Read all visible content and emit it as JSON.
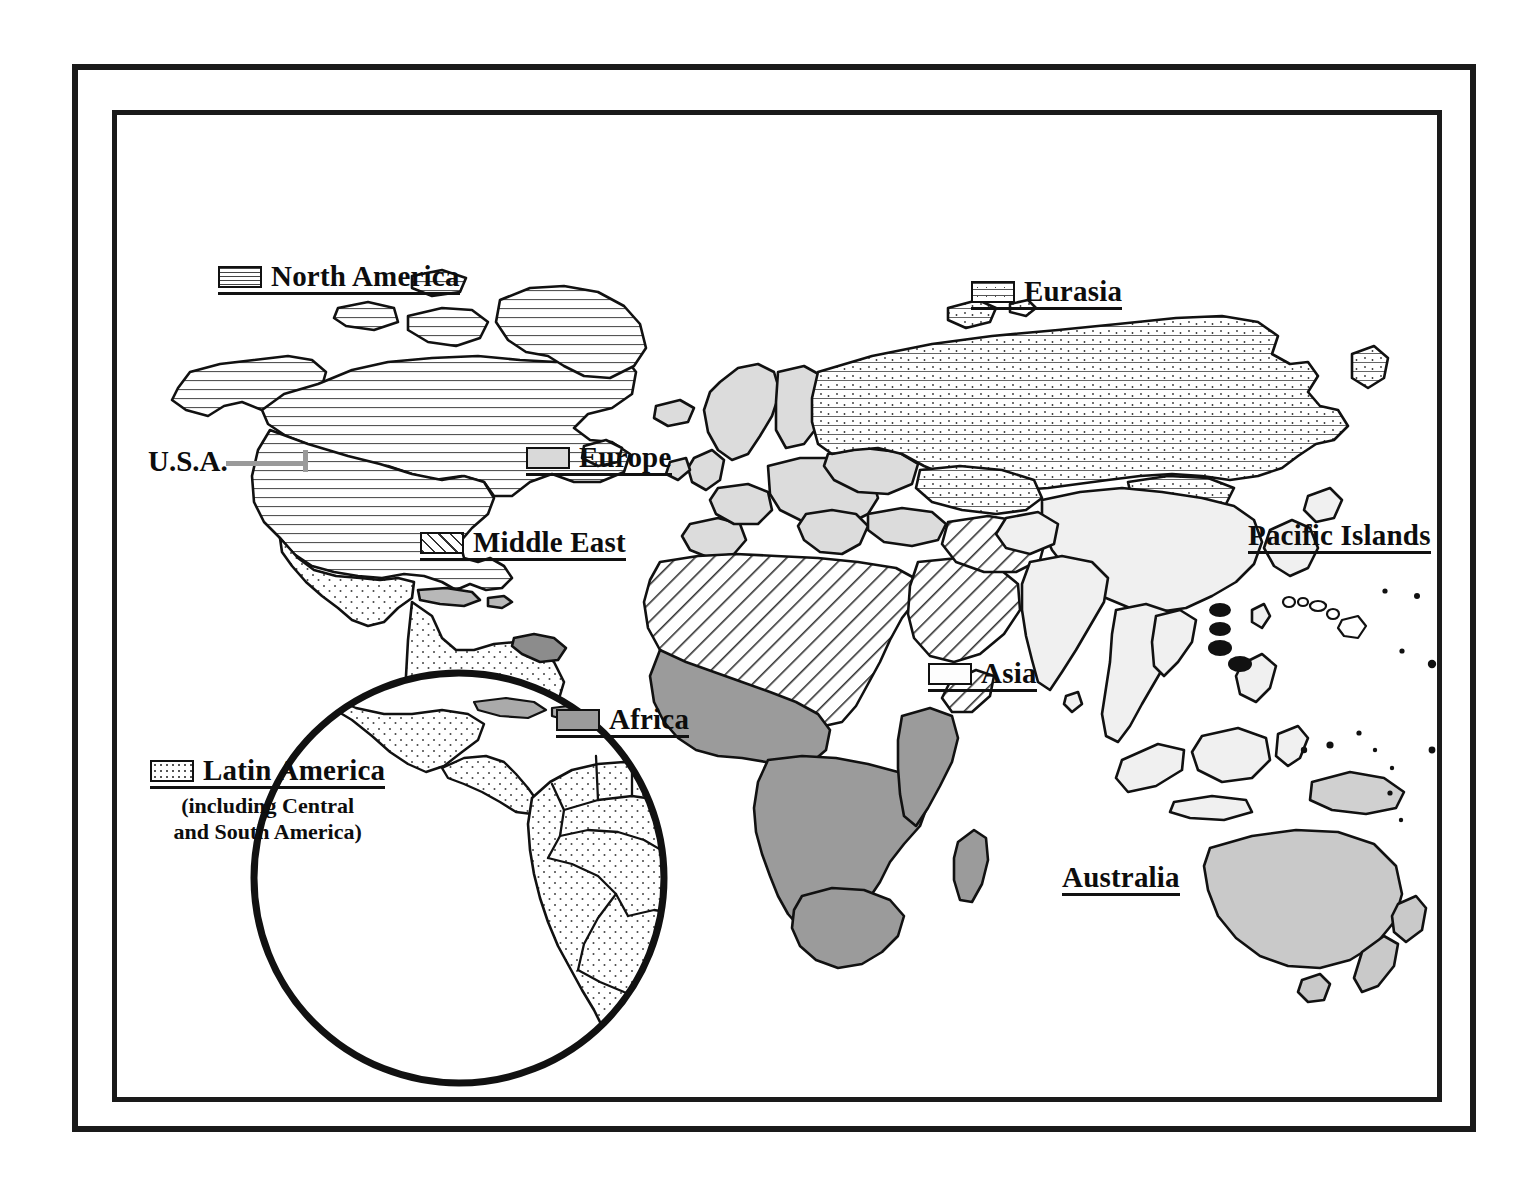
{
  "figure": {
    "frame": {
      "style": "double-rule-border",
      "color": "#1a1a1a"
    }
  },
  "legend": {
    "items": [
      {
        "id": "north-america",
        "label": "North America",
        "pattern": "horizontal-lines",
        "swatch": true,
        "x": 218,
        "y": 262
      },
      {
        "id": "eurasia",
        "label": "Eurasia",
        "pattern": "horizontal-lines-with-dots",
        "swatch": true,
        "x": 971,
        "y": 277
      },
      {
        "id": "europe",
        "label": "Europe",
        "pattern": "solid-light-gray",
        "swatch": true,
        "x": 526,
        "y": 443
      },
      {
        "id": "middle-east",
        "label": "Middle East",
        "pattern": "diagonal-hatch",
        "swatch": true,
        "x": 420,
        "y": 528
      },
      {
        "id": "africa",
        "label": "Africa",
        "pattern": "solid-medium-gray",
        "swatch": true,
        "x": 556,
        "y": 705
      },
      {
        "id": "asia",
        "label": "Asia",
        "pattern": "white",
        "swatch": true,
        "x": 928,
        "y": 659
      },
      {
        "id": "latin-america",
        "label": "Latin America",
        "pattern": "stipple-dots",
        "swatch": true,
        "sublabel_line1": "(including Central",
        "sublabel_line2": "and South America)",
        "x": 150,
        "y": 756
      },
      {
        "id": "pacific-islands",
        "label": "Pacific Islands",
        "pattern": "none",
        "swatch": false,
        "x": 1248,
        "y": 521
      },
      {
        "id": "australia",
        "label": "Australia",
        "pattern": "none",
        "swatch": false,
        "x": 1062,
        "y": 863
      }
    ],
    "callouts": [
      {
        "id": "usa",
        "label": "U.S.A.",
        "x": 148,
        "y": 445,
        "leader": true
      }
    ]
  },
  "colors": {
    "ink": "#0d0d0d",
    "frame": "#1a1a1a",
    "africa_fill": "#9b9b9b",
    "europe_fill": "#d9d9d9",
    "asia_fill": "#f2f2f2",
    "australia_fill": "#c9c9c9",
    "latin_america_fill": "#fbfbfb",
    "guyana_fill": "#8c8c8c",
    "ocean": "#ffffff"
  },
  "map": {
    "projection": "world-equirectangular-stylized",
    "inset": {
      "id": "latin-america-inset",
      "shape": "circle",
      "cx": 347,
      "cy": 768,
      "r": 208
    },
    "pacific_dots": {
      "count": 4,
      "description": "four filled ellipses west of Hawaii"
    }
  }
}
